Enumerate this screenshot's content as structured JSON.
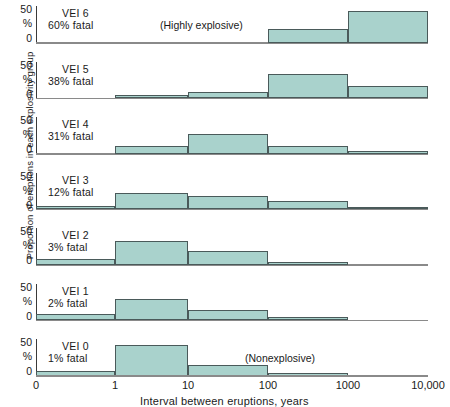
{
  "chart_data": {
    "type": "bar",
    "title": "",
    "xlabel": "Interval between eruptions, years",
    "ylabel": "Proportion of eruptions in each explosivity group",
    "ylim": [
      0,
      50
    ],
    "ytick_labels": [
      "50",
      "%",
      "0"
    ],
    "yunit": "%",
    "grid": false,
    "legend": null,
    "x_scale": "log",
    "x_tick_labels": [
      "0",
      "1",
      "10",
      "100",
      "1000",
      "10,000"
    ],
    "categories": [
      "0-1",
      "1-10",
      "10-100",
      "100-1000",
      "1000-10,000"
    ],
    "annotations": [
      {
        "text": "(Highly explosive)",
        "panel": "VEI 6"
      },
      {
        "text": "(Nonexplosive)",
        "panel": "VEI 0"
      }
    ],
    "series": [
      {
        "name": "VEI 6",
        "fatal_label": "60% fatal",
        "note": "(Highly explosive)",
        "values": [
          0,
          0,
          0,
          18,
          43
        ]
      },
      {
        "name": "VEI 5",
        "fatal_label": "38% fatal",
        "note": "",
        "values": [
          0,
          3,
          8,
          32,
          16
        ]
      },
      {
        "name": "VEI 4",
        "fatal_label": "31% fatal",
        "note": "",
        "values": [
          0,
          10,
          26,
          10,
          3
        ]
      },
      {
        "name": "VEI 3",
        "fatal_label": "12% fatal",
        "note": "",
        "values": [
          4,
          22,
          18,
          10,
          2
        ]
      },
      {
        "name": "VEI 2",
        "fatal_label": "3% fatal",
        "note": "",
        "values": [
          7,
          32,
          18,
          3,
          0
        ]
      },
      {
        "name": "VEI 1",
        "fatal_label": "2% fatal",
        "note": "",
        "values": [
          8,
          28,
          13,
          3,
          0
        ]
      },
      {
        "name": "VEI 0",
        "fatal_label": "1% fatal",
        "note": "(Nonexplosive)",
        "values": [
          5,
          42,
          14,
          3,
          0
        ]
      }
    ]
  },
  "axes": {
    "y_top_label": "50",
    "y_pct_label": "%",
    "y_zero_label": "0",
    "x_title": "Interval between eruptions, years",
    "y_title": "Proportion of eruptions in each explosivity group"
  },
  "colors": {
    "bar_fill": "#a9d2cc",
    "bar_stroke": "#4a5a5a",
    "axis": "#8a8a8a",
    "text": "#1a1a1a",
    "background": "#ffffff"
  }
}
